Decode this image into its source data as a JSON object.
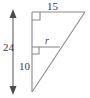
{
  "figure": {
    "type": "geometry-diagram",
    "background_color": "#ffffff",
    "stroke_color": "#8a8a8a",
    "label_color": "#3b3b3b",
    "labels": {
      "top_side": "15",
      "total_height": "24",
      "lower_segment": "10",
      "interior_segment": "r"
    },
    "markers": {
      "right_angle_top": "right-angle-square",
      "right_angle_middle": "right-angle-square",
      "height_dimension": "double-headed-arrow"
    },
    "geometry": {
      "apex_bottom": [
        32,
        92
      ],
      "vertical_top": [
        32,
        12
      ],
      "top_right": [
        85,
        12
      ],
      "interior_right": [
        60,
        47
      ],
      "interior_left": [
        32,
        47
      ],
      "arrow_x": 13,
      "arrow_top_y": 12,
      "arrow_bottom_y": 92
    }
  }
}
